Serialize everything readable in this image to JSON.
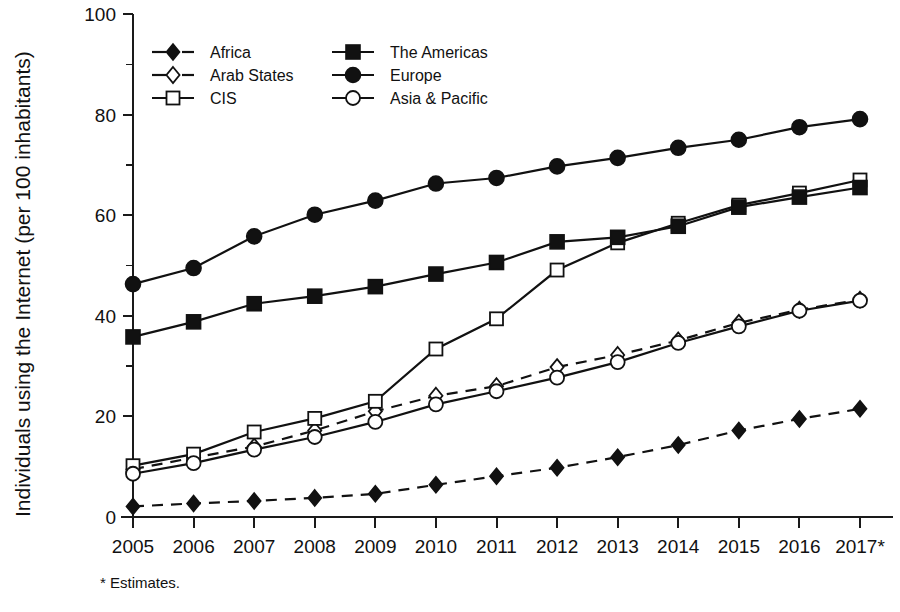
{
  "chart_data": {
    "type": "line",
    "title": "",
    "xlabel": "",
    "ylabel": "Individuals using the Internet (per 100 inhabitants)",
    "categories": [
      "2005",
      "2006",
      "2007",
      "2008",
      "2009",
      "2010",
      "2011",
      "2012",
      "2013",
      "2014",
      "2015",
      "2016",
      "2017*"
    ],
    "x": [
      2005,
      2006,
      2007,
      2008,
      2009,
      2010,
      2011,
      2012,
      2013,
      2014,
      2015,
      2016,
      2017
    ],
    "ylim": [
      0,
      100
    ],
    "yticks": [
      0,
      20,
      40,
      60,
      80,
      100
    ],
    "yticks_minor": [
      10,
      30,
      50,
      70,
      90
    ],
    "ytick_labels": [
      "0",
      "20",
      "40",
      "60",
      "80",
      "100"
    ],
    "grid": false,
    "legend_position": "top-left-inside",
    "footnote": "* Estimates.",
    "series": [
      {
        "name": "Africa",
        "marker": "filled-diamond",
        "line_style": "dashed",
        "color": "#111111",
        "values": [
          2.1,
          2.7,
          3.2,
          3.8,
          4.6,
          6.4,
          8.1,
          9.8,
          11.9,
          14.3,
          17.2,
          19.5,
          21.5
        ]
      },
      {
        "name": "Arab States",
        "marker": "open-diamond",
        "line_style": "dashed",
        "color": "#111111",
        "values": [
          9.5,
          11.8,
          14.0,
          17.2,
          21.0,
          24.1,
          26.0,
          29.8,
          32.2,
          35.1,
          38.6,
          41.2,
          43.2
        ]
      },
      {
        "name": "CIS",
        "marker": "open-square",
        "line_style": "solid",
        "color": "#111111",
        "values": [
          10.2,
          12.5,
          16.9,
          19.6,
          23.0,
          33.4,
          39.4,
          49.1,
          54.5,
          58.4,
          62.0,
          64.4,
          67.0
        ]
      },
      {
        "name": "The Americas",
        "marker": "filled-square",
        "line_style": "solid",
        "color": "#111111",
        "values": [
          35.8,
          38.8,
          42.4,
          43.9,
          45.8,
          48.3,
          50.6,
          54.7,
          55.6,
          57.8,
          61.6,
          63.6,
          65.5
        ]
      },
      {
        "name": "Europe",
        "marker": "filled-circle",
        "line_style": "solid",
        "color": "#111111",
        "values": [
          46.3,
          49.5,
          55.8,
          60.1,
          62.9,
          66.3,
          67.4,
          69.7,
          71.4,
          73.4,
          75.0,
          77.5,
          79.1
        ]
      },
      {
        "name": "Asia & Pacific",
        "marker": "open-circle",
        "line_style": "solid",
        "color": "#111111",
        "values": [
          8.6,
          10.7,
          13.4,
          15.9,
          18.9,
          22.4,
          25.0,
          27.7,
          30.8,
          34.6,
          37.9,
          41.0,
          43.0
        ]
      }
    ],
    "legend": [
      {
        "label": "Africa",
        "marker": "filled-diamond",
        "line_style": "dashed"
      },
      {
        "label": "Arab States",
        "marker": "open-diamond",
        "line_style": "dashed"
      },
      {
        "label": "CIS",
        "marker": "open-square",
        "line_style": "solid"
      },
      {
        "label": "The Americas",
        "marker": "filled-square",
        "line_style": "solid"
      },
      {
        "label": "Europe",
        "marker": "filled-circle",
        "line_style": "solid"
      },
      {
        "label": "Asia & Pacific",
        "marker": "open-circle",
        "line_style": "solid"
      }
    ]
  }
}
